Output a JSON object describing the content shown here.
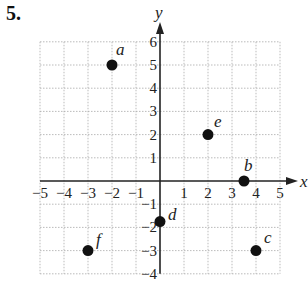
{
  "problem_number": "5.",
  "chart_data": {
    "type": "scatter",
    "title": "",
    "xlabel": "x",
    "ylabel": "y",
    "xlim": [
      -5,
      5
    ],
    "ylim": [
      -4,
      6
    ],
    "grid": true,
    "x_ticks": [
      -5,
      -4,
      -3,
      -2,
      -1,
      1,
      2,
      3,
      4,
      5
    ],
    "y_ticks": [
      -4,
      -3,
      -2,
      -1,
      1,
      2,
      3,
      4,
      5,
      6
    ],
    "points": [
      {
        "label": "a",
        "x": -2,
        "y": 5
      },
      {
        "label": "b",
        "x": 3.5,
        "y": 0
      },
      {
        "label": "c",
        "x": 4,
        "y": -3
      },
      {
        "label": "d",
        "x": 0,
        "y": -1.75
      },
      {
        "label": "e",
        "x": 2,
        "y": 2
      },
      {
        "label": "f",
        "x": -3,
        "y": -3
      }
    ]
  }
}
